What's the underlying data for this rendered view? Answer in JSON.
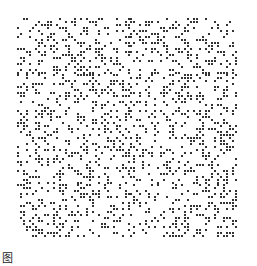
{
  "figure": {
    "type": "random binary dot pattern",
    "grid": {
      "cols": 74,
      "rows": 74,
      "density": 0.28,
      "seed": 1337
    },
    "colors": {
      "background": "#ffffff",
      "dot": "#333333"
    }
  },
  "caption": {
    "text": "图"
  }
}
